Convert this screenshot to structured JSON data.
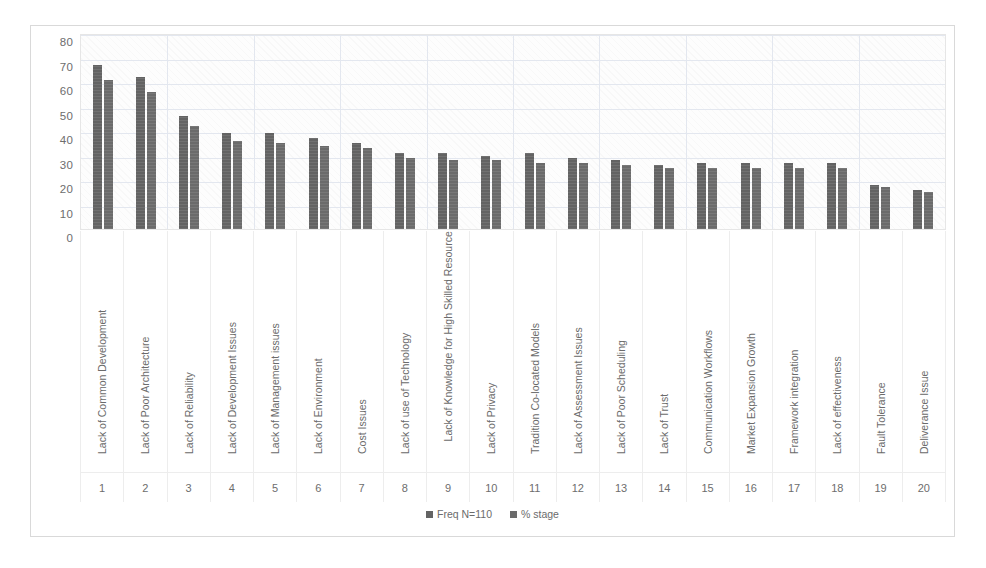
{
  "chart_data": {
    "type": "bar",
    "title": "",
    "xlabel": "",
    "ylabel": "",
    "ylim": [
      0,
      80
    ],
    "yticks": [
      80,
      70,
      60,
      50,
      40,
      30,
      20,
      10,
      0
    ],
    "grid": true,
    "legend_position": "bottom",
    "indices": [
      "1",
      "2",
      "3",
      "4",
      "5",
      "6",
      "7",
      "8",
      "9",
      "10",
      "11",
      "12",
      "13",
      "14",
      "15",
      "16",
      "17",
      "18",
      "19",
      "20"
    ],
    "categories": [
      "Lack of Common Development",
      "Lack of Poor Architecture",
      "Lack of Reliability",
      "Lack of Development Issues",
      "Lack of Management issues",
      "Lack of Environment",
      "Cost Issues",
      "Lack of use of Technology",
      "Lack of Knowledge for High Skilled Resources",
      "Lack of Privacy",
      "Tradition Co-located Models",
      "Lack of Assessment Issues",
      "Lack of Poor Scheduling",
      "Lack of Trust",
      "Communication Workflows",
      "Market Expansion Growth",
      "Framework integration",
      "Lack of effectiveness",
      "Fault Tolerance",
      "Deliverance Issue"
    ],
    "series": [
      {
        "name": "Freq N=110",
        "color": "#636363",
        "values": [
          67,
          62,
          46,
          39,
          39,
          37,
          35,
          31,
          31,
          30,
          31,
          29,
          28,
          26,
          27,
          27,
          27,
          27,
          18,
          16
        ]
      },
      {
        "name": "% stage",
        "color": "#6B6B6B",
        "values": [
          61,
          56,
          42,
          36,
          35,
          34,
          33,
          29,
          28,
          28,
          27,
          27,
          26,
          25,
          25,
          25,
          25,
          25,
          17,
          15
        ]
      }
    ]
  },
  "legend": {
    "items": [
      {
        "label": "Freq N=110"
      },
      {
        "label": "% stage"
      }
    ]
  },
  "caption": {
    "text": ""
  }
}
